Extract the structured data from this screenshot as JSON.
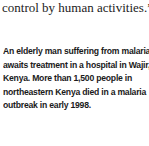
{
  "quote": {
    "text": "control by human activities.”"
  },
  "caption": {
    "text": "An elderly man suffering from malaria awaits treatment in a hospital in Wajir, Kenya. More than 1,500 people in northeastern Kenya died in a malaria outbreak in early 1998."
  }
}
